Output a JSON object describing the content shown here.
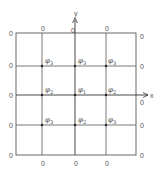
{
  "diagram": {
    "axes": {
      "x_label": "x",
      "y_label": "y"
    },
    "boundary_value": "0",
    "grid": {
      "columns_x": [
        16,
        42,
        75,
        106,
        136
      ],
      "rows_y": [
        33,
        66,
        95,
        125,
        155
      ]
    },
    "boundary_labels": {
      "top": [
        {
          "x": 42,
          "text": "0"
        },
        {
          "x": 72,
          "text": "0"
        },
        {
          "x": 106,
          "text": "0"
        }
      ],
      "bottom": [
        {
          "x": 42,
          "text": "0"
        },
        {
          "x": 75,
          "text": "0"
        },
        {
          "x": 106,
          "text": "0"
        }
      ],
      "left": [
        {
          "y": 33,
          "text": "0"
        },
        {
          "y": 64,
          "text": "0"
        },
        {
          "y": 95,
          "text": "0"
        },
        {
          "y": 125,
          "text": "0"
        },
        {
          "y": 155,
          "text": "0"
        }
      ],
      "right": [
        {
          "y": 35,
          "text": "0"
        },
        {
          "y": 66,
          "text": "0"
        },
        {
          "y": 102,
          "text": "0"
        },
        {
          "y": 125,
          "text": "0"
        },
        {
          "y": 155,
          "text": "0"
        }
      ]
    },
    "nodes": [
      {
        "x": 42,
        "y": 66,
        "symbol": "φ",
        "sub": "3"
      },
      {
        "x": 75,
        "y": 66,
        "symbol": "φ",
        "sub": "3"
      },
      {
        "x": 106,
        "y": 66,
        "symbol": "φ",
        "sub": "3"
      },
      {
        "x": 42,
        "y": 95,
        "symbol": "φ",
        "sub": "2"
      },
      {
        "x": 75,
        "y": 95,
        "symbol": "φ",
        "sub": "1"
      },
      {
        "x": 106,
        "y": 95,
        "symbol": "φ",
        "sub": "2"
      },
      {
        "x": 42,
        "y": 125,
        "symbol": "φ",
        "sub": "3"
      },
      {
        "x": 75,
        "y": 125,
        "symbol": "φ",
        "sub": "2"
      },
      {
        "x": 106,
        "y": 125,
        "symbol": "φ",
        "sub": "3"
      }
    ],
    "colors": {
      "line": "#3a3a3a",
      "text": "#555555"
    }
  }
}
